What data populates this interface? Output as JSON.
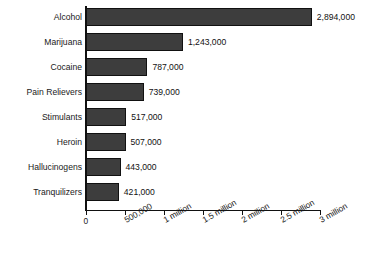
{
  "chart_data": {
    "type": "bar",
    "orientation": "horizontal",
    "title": "",
    "xlabel": "",
    "ylabel": "",
    "grid": false,
    "legend": "none",
    "xlim": [
      0,
      3000000
    ],
    "categories": [
      "Alcohol",
      "Marijuana",
      "Cocaine",
      "Pain Relievers",
      "Stimulants",
      "Heroin",
      "Hallucinogens",
      "Tranquilizers"
    ],
    "values": [
      2894000,
      1243000,
      787000,
      739000,
      517000,
      507000,
      443000,
      421000
    ],
    "value_labels": [
      "2,894,000",
      "1,243,000",
      "787,000",
      "739,000",
      "517,000",
      "507,000",
      "443,000",
      "421,000"
    ],
    "xticks": [
      0,
      500000,
      1000000,
      1500000,
      2000000,
      2500000,
      3000000
    ],
    "xtick_labels": [
      "0",
      "500,000",
      "1 million",
      "1.5 million",
      "2 million",
      "2.5 million",
      "3 million"
    ],
    "bar_color": "#3d3d3d",
    "bar_edge_color": "#111111",
    "axis_color": "#111111",
    "background": "#ffffff"
  }
}
